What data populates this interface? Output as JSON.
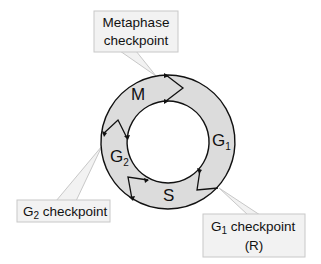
{
  "diagram": {
    "colors": {
      "ring_fill": "#dcdcdc",
      "ring_stroke": "#111111",
      "callout_fill": "#f2f2f2",
      "callout_stroke": "#c8c8c8",
      "background": "#ffffff"
    },
    "phases": [
      {
        "id": "M",
        "label": "M",
        "sub": ""
      },
      {
        "id": "G1",
        "label": "G",
        "sub": "1"
      },
      {
        "id": "S",
        "label": "S",
        "sub": ""
      },
      {
        "id": "G2",
        "label": "G",
        "sub": "2"
      }
    ],
    "callouts": {
      "metaphase": {
        "line1": "Metaphase",
        "line2": "checkpoint"
      },
      "g2": {
        "prefix": "G",
        "sub": "2",
        "suffix": " checkpoint"
      },
      "g1": {
        "prefix": "G",
        "sub": "1",
        "suffix": " checkpoint",
        "line2": "(R)"
      }
    }
  }
}
